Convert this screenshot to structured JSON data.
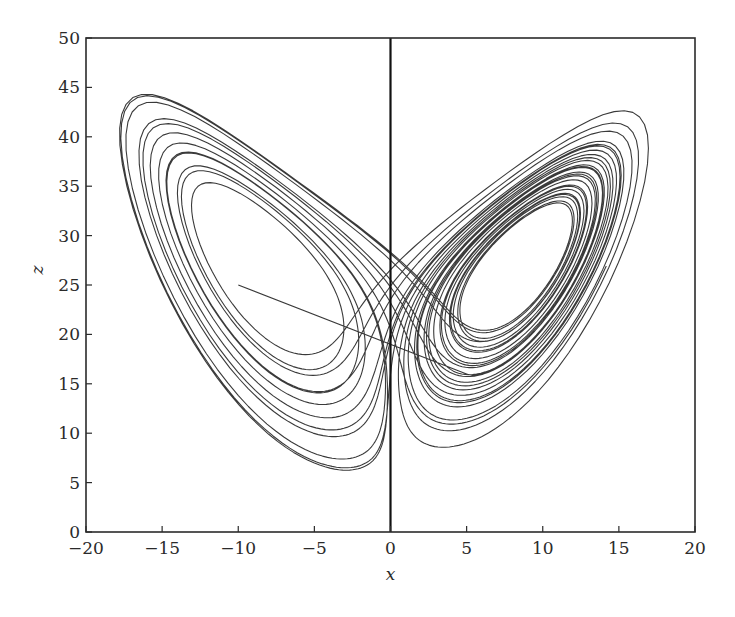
{
  "chart_data": {
    "type": "line",
    "title": "",
    "xlabel": "x",
    "ylabel": "z",
    "xlim": [
      -20,
      20
    ],
    "ylim": [
      0,
      50
    ],
    "xticks": [
      -20,
      -15,
      -10,
      -5,
      0,
      5,
      10,
      15,
      20
    ],
    "yticks": [
      0,
      5,
      10,
      15,
      20,
      25,
      30,
      35,
      40,
      45,
      50
    ],
    "xtick_labels": [
      "−20",
      "−15",
      "−10",
      "−5",
      "0",
      "5",
      "10",
      "15",
      "20"
    ],
    "ytick_labels": [
      "0",
      "5",
      "10",
      "15",
      "20",
      "25",
      "30",
      "35",
      "40",
      "45",
      "50"
    ],
    "grid": false,
    "legend": null,
    "reference_lines": [
      {
        "orientation": "vertical",
        "x": 0,
        "description": "z-axis line at x = 0"
      }
    ],
    "series": [
      {
        "name": "Lorenz attractor (x-z projection)",
        "system": "lorenz",
        "parameters": {
          "sigma": 10,
          "rho": 28,
          "beta": 2.6667
        },
        "initial_condition": {
          "x": -10,
          "y": -6,
          "z": 25
        },
        "approx_extent": {
          "x_min": -16,
          "x_max": 16.5,
          "z_min": 6.5,
          "z_max": 44.5
        },
        "key_points": [
          {
            "x": -10,
            "z": 25,
            "note": "start of trajectory"
          },
          {
            "x": 5,
            "z": 16,
            "note": "end of initial straight transient"
          },
          {
            "x": -16,
            "z": 44,
            "note": "left lobe peak"
          },
          {
            "x": 16.5,
            "z": 44.5,
            "note": "right lobe peak"
          },
          {
            "x": 2.5,
            "z": 6.5,
            "note": "lowest point"
          }
        ],
        "color": "#3a3a3a"
      }
    ]
  },
  "plot": {
    "frame_color": "#2b2b2b",
    "line_color": "#3a3a3a",
    "zero_line_color": "#111111"
  }
}
